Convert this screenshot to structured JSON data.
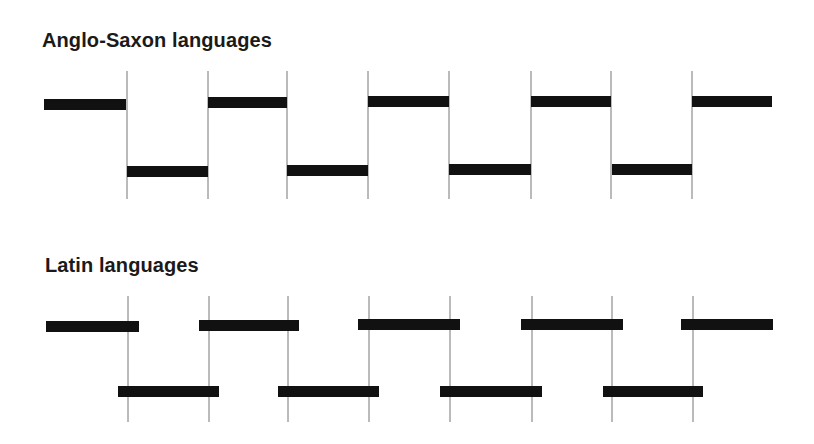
{
  "sections": [
    {
      "title": "Anglo-Saxon languages",
      "title_pos": {
        "x": 42,
        "y": 29
      },
      "lines": {
        "xs": [
          127,
          208,
          287,
          368,
          449,
          531,
          611,
          692
        ],
        "y1": 71,
        "y2": 199
      },
      "bars": [
        {
          "x1": 44,
          "x2": 126,
          "y": 99,
          "level": "high"
        },
        {
          "x1": 127,
          "x2": 208,
          "y": 166,
          "level": "low"
        },
        {
          "x1": 208,
          "x2": 287,
          "y": 97,
          "level": "high"
        },
        {
          "x1": 287,
          "x2": 368,
          "y": 165,
          "level": "low"
        },
        {
          "x1": 368,
          "x2": 449,
          "y": 96,
          "level": "high"
        },
        {
          "x1": 449,
          "x2": 531,
          "y": 164,
          "level": "low"
        },
        {
          "x1": 531,
          "x2": 611,
          "y": 96,
          "level": "high"
        },
        {
          "x1": 612,
          "x2": 692,
          "y": 164,
          "level": "low"
        },
        {
          "x1": 692,
          "x2": 772,
          "y": 96,
          "level": "high"
        }
      ]
    },
    {
      "title": "Latin languages",
      "title_pos": {
        "x": 45,
        "y": 254
      },
      "lines": {
        "xs": [
          128,
          209,
          288,
          369,
          450,
          532,
          612,
          693
        ],
        "y1": 296,
        "y2": 422
      },
      "bars": [
        {
          "x1": 46,
          "x2": 139,
          "y": 321,
          "level": "high"
        },
        {
          "x1": 118,
          "x2": 219,
          "y": 386,
          "level": "low"
        },
        {
          "x1": 199,
          "x2": 299,
          "y": 320,
          "level": "high"
        },
        {
          "x1": 278,
          "x2": 379,
          "y": 386,
          "level": "low"
        },
        {
          "x1": 358,
          "x2": 460,
          "y": 319,
          "level": "high"
        },
        {
          "x1": 440,
          "x2": 542,
          "y": 386,
          "level": "low"
        },
        {
          "x1": 521,
          "x2": 623,
          "y": 319,
          "level": "high"
        },
        {
          "x1": 603,
          "x2": 703,
          "y": 386,
          "level": "low"
        },
        {
          "x1": 681,
          "x2": 773,
          "y": 319,
          "level": "high"
        }
      ]
    }
  ],
  "style": {
    "bar_color": "#111111",
    "line_color": "#777777",
    "bar_height": 11
  }
}
